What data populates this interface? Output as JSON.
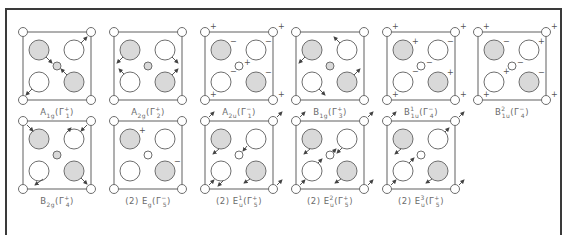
{
  "figure": {
    "colors": {
      "frame": "#3a3a3a",
      "line": "#6e6e6e",
      "shaded_atom": "#d9d9d9",
      "open_atom": "#ffffff",
      "label": "#6b6b6b"
    },
    "legend": {
      "shaded_atom": "shaded large atom",
      "open_atom": "open large atom",
      "center_atom": "small central atom",
      "corner_atom": "small corner atom",
      "arrow": "in-plane displacement",
      "plus_minus": "out-of-plane displacement (+ up / - down)"
    }
  },
  "modes": [
    {
      "id": "A1g",
      "label": "A_{1g}(Γ_1^+)",
      "text": "A1g(Γ1+)",
      "prefix": "",
      "sym": "A",
      "sub": "1g",
      "sup": "",
      "gsub": "1",
      "gsup": "+",
      "row": 0,
      "col": 0,
      "type": "breathing"
    },
    {
      "id": "A2g",
      "label": "A_{2g}(Γ_2^+)",
      "text": "A2g(Γ2+)",
      "prefix": "",
      "sym": "A",
      "sub": "2g",
      "sup": "",
      "gsub": "2",
      "gsup": "+",
      "row": 0,
      "col": 1,
      "type": "rotation"
    },
    {
      "id": "A2u",
      "label": "A_{2u}(Γ_1^-)",
      "text": "A2u(Γ1−)",
      "prefix": "",
      "sym": "A",
      "sub": "2u",
      "sup": "",
      "gsub": "1",
      "gsup": "−",
      "row": 0,
      "col": 2,
      "type": "signs",
      "signs": {
        "corners": "+",
        "center": "+",
        "tl": "−",
        "tr": "−",
        "bl": "−",
        "br": "−"
      }
    },
    {
      "id": "B1g",
      "label": "B_{1g}(Γ_3^+)",
      "text": "B1g(Γ3+)",
      "prefix": "",
      "sym": "B",
      "sub": "1g",
      "sup": "",
      "gsub": "3",
      "gsup": "+",
      "row": 0,
      "col": 3,
      "type": "b1g"
    },
    {
      "id": "B1u1",
      "label": "B^1_{1u}(Γ_4^-)",
      "text": "B1u1(Γ4−)",
      "prefix": "",
      "sym": "B",
      "sub": "1u",
      "sup": "1",
      "gsub": "4",
      "gsup": "−",
      "row": 0,
      "col": 4,
      "type": "signs",
      "signs": {
        "corners": "+",
        "center": "−",
        "tl": "+",
        "tr": "−",
        "bl": "−",
        "br": "+"
      }
    },
    {
      "id": "B1u2",
      "label": "B^2_{1u}(Γ_4^-)",
      "text": "B1u2(Γ4−)",
      "prefix": "",
      "sym": "B",
      "sub": "1u",
      "sup": "2",
      "gsub": "4",
      "gsup": "−",
      "row": 0,
      "col": 5,
      "type": "signs",
      "signs": {
        "corners": "+",
        "center": "−",
        "tl": "−",
        "tr": "+",
        "bl": "+",
        "br": "−"
      }
    },
    {
      "id": "B2g",
      "label": "B_{2g}(Γ_4^+)",
      "text": "B2g(Γ4+)",
      "prefix": "",
      "sym": "B",
      "sub": "2g",
      "sup": "",
      "gsub": "4",
      "gsup": "+",
      "row": 1,
      "col": 0,
      "type": "b2g"
    },
    {
      "id": "Eg",
      "label": "(2)E_g(Γ_5^-)",
      "text": "(2)Eg(Γ5−)",
      "prefix": "(2)",
      "sym": "E",
      "sub": "g",
      "sup": "",
      "gsub": "5",
      "gsup": "−",
      "row": 1,
      "col": 1,
      "type": "signs",
      "signs": {
        "tl": "+",
        "br": "−"
      }
    },
    {
      "id": "Eu1",
      "label": "(2)E^1_u(Γ_5^+)",
      "text": "(2)Eu1(Γ5+)",
      "prefix": "(2)",
      "sym": "E",
      "sub": "u",
      "sup": "1",
      "gsub": "5",
      "gsup": "+",
      "row": 1,
      "col": 2,
      "type": "eu1"
    },
    {
      "id": "Eu2",
      "label": "(2)E^2_u(Γ_5^+)",
      "text": "(2)Eu2(Γ5+)",
      "prefix": "(2)",
      "sym": "E",
      "sub": "u",
      "sup": "2",
      "gsub": "5",
      "gsup": "+",
      "row": 1,
      "col": 3,
      "type": "eu2"
    },
    {
      "id": "Eu3",
      "label": "(2)E^3_u(Γ_5^+)",
      "text": "(2)Eu3(Γ5+)",
      "prefix": "(2)",
      "sym": "E",
      "sub": "u",
      "sup": "3",
      "gsub": "5",
      "gsup": "+",
      "row": 1,
      "col": 4,
      "type": "eu3"
    }
  ]
}
